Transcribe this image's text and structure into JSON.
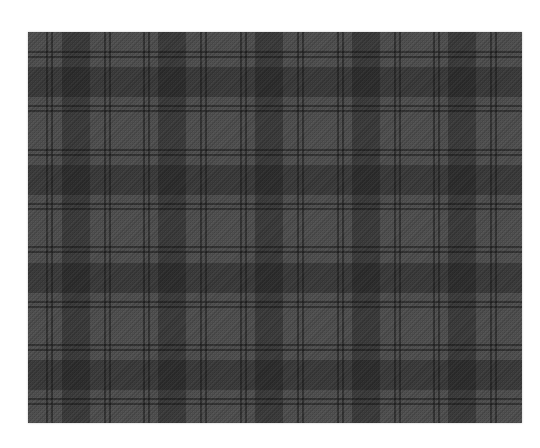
{
  "image": {
    "subject": "grey tartan plaid fabric swatch",
    "colors": {
      "background": "#ffffff",
      "base": "#525252",
      "wide_band": "rgba(20,20,20,0.32)",
      "thin_line": "rgba(15,15,15,0.45)"
    },
    "swatch": {
      "x": 28,
      "y": 32,
      "width": 494,
      "height": 391
    },
    "vertical_bands": [
      {
        "x": 34,
        "w": 28
      },
      {
        "x": 130,
        "w": 28
      },
      {
        "x": 227,
        "w": 28
      },
      {
        "x": 324,
        "w": 28
      },
      {
        "x": 420,
        "w": 28
      }
    ],
    "vertical_lines": [
      {
        "x": 18,
        "w": 2
      },
      {
        "x": 23,
        "w": 2
      },
      {
        "x": 76,
        "w": 2
      },
      {
        "x": 81,
        "w": 2
      },
      {
        "x": 115,
        "w": 2
      },
      {
        "x": 120,
        "w": 2
      },
      {
        "x": 172,
        "w": 2
      },
      {
        "x": 177,
        "w": 2
      },
      {
        "x": 212,
        "w": 2
      },
      {
        "x": 217,
        "w": 2
      },
      {
        "x": 269,
        "w": 2
      },
      {
        "x": 274,
        "w": 2
      },
      {
        "x": 309,
        "w": 2
      },
      {
        "x": 314,
        "w": 2
      },
      {
        "x": 366,
        "w": 2
      },
      {
        "x": 371,
        "w": 2
      },
      {
        "x": 405,
        "w": 2
      },
      {
        "x": 410,
        "w": 2
      },
      {
        "x": 462,
        "w": 2
      },
      {
        "x": 467,
        "w": 2
      }
    ],
    "horizontal_bands": [
      {
        "y": 35,
        "h": 30
      },
      {
        "y": 133,
        "h": 30
      },
      {
        "y": 231,
        "h": 30
      },
      {
        "y": 328,
        "h": 30
      }
    ],
    "horizontal_lines": [
      {
        "y": 19,
        "h": 2
      },
      {
        "y": 24,
        "h": 2
      },
      {
        "y": 73,
        "h": 2
      },
      {
        "y": 78,
        "h": 2
      },
      {
        "y": 117,
        "h": 2
      },
      {
        "y": 122,
        "h": 2
      },
      {
        "y": 171,
        "h": 2
      },
      {
        "y": 176,
        "h": 2
      },
      {
        "y": 214,
        "h": 2
      },
      {
        "y": 219,
        "h": 2
      },
      {
        "y": 269,
        "h": 2
      },
      {
        "y": 274,
        "h": 2
      },
      {
        "y": 312,
        "h": 2
      },
      {
        "y": 317,
        "h": 2
      },
      {
        "y": 366,
        "h": 2
      },
      {
        "y": 371,
        "h": 2
      }
    ]
  }
}
